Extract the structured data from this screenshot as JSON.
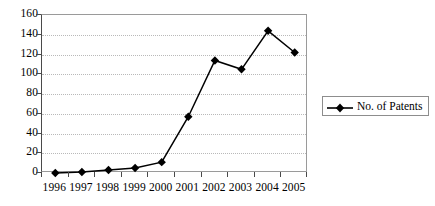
{
  "chart_data": {
    "type": "line",
    "title": "",
    "xlabel": "",
    "ylabel": "",
    "categories": [
      "1996",
      "1997",
      "1998",
      "1999",
      "2000",
      "2001",
      "2002",
      "2003",
      "2004",
      "2005"
    ],
    "series": [
      {
        "name": "No. of Patents",
        "values": [
          0,
          1,
          3,
          5,
          11,
          57,
          114,
          105,
          144,
          122
        ],
        "color": "#000000",
        "marker": "diamond"
      }
    ],
    "ylim": [
      0,
      160
    ],
    "ytick_labels": [
      "0",
      "20",
      "40",
      "60",
      "80",
      "100",
      "120",
      "140",
      "160"
    ],
    "ytick_values": [
      0,
      20,
      40,
      60,
      80,
      100,
      120,
      140,
      160
    ],
    "grid": "horizontal-dotted",
    "legend_position": "right",
    "plot_border_color": "#9a9a9a",
    "gridline_color": "#b9b9b9",
    "background_color": "#ffffff"
  },
  "legend": {
    "entries": [
      {
        "label": "No. of Patents"
      }
    ]
  }
}
